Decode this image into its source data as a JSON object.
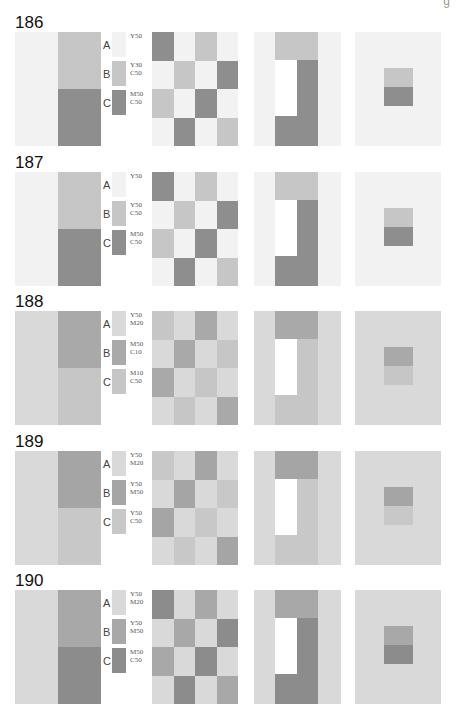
{
  "page_mark": "g",
  "sections": [
    {
      "number": "186",
      "colors": {
        "A": "#f2f2f2",
        "B": "#c6c6c6",
        "C": "#8e8e8e"
      },
      "legend": [
        {
          "letter": "A",
          "code": "Y50"
        },
        {
          "letter": "B",
          "code": "Y30\nC50"
        },
        {
          "letter": "C",
          "code": "M50\nC50"
        }
      ]
    },
    {
      "number": "187",
      "colors": {
        "A": "#f2f2f2",
        "B": "#c6c6c6",
        "C": "#8e8e8e"
      },
      "legend": [
        {
          "letter": "A",
          "code": "Y50"
        },
        {
          "letter": "B",
          "code": "Y50\nC50"
        },
        {
          "letter": "C",
          "code": "M50\nC50"
        }
      ]
    },
    {
      "number": "188",
      "colors": {
        "A": "#d9d9d9",
        "B": "#a9a9a9",
        "C": "#c6c6c6"
      },
      "legend": [
        {
          "letter": "A",
          "code": "Y50\nM20"
        },
        {
          "letter": "B",
          "code": "M50\nC10"
        },
        {
          "letter": "C",
          "code": "M10\nC50"
        }
      ]
    },
    {
      "number": "189",
      "colors": {
        "A": "#d9d9d9",
        "B": "#a5a5a5",
        "C": "#c8c8c8"
      },
      "legend": [
        {
          "letter": "A",
          "code": "Y50\nM20"
        },
        {
          "letter": "B",
          "code": "Y50\nM50"
        },
        {
          "letter": "C",
          "code": "Y50\nC50"
        }
      ]
    },
    {
      "number": "190",
      "colors": {
        "A": "#d9d9d9",
        "B": "#a8a8a8",
        "C": "#8c8c8c"
      },
      "legend": [
        {
          "letter": "A",
          "code": "Y50\nM20"
        },
        {
          "letter": "B",
          "code": "Y50\nM50"
        },
        {
          "letter": "C",
          "code": "M50\nC50"
        }
      ]
    }
  ],
  "checker_pattern": [
    [
      "C",
      "A",
      "B",
      "A"
    ],
    [
      "A",
      "B",
      "A",
      "C"
    ],
    [
      "B",
      "A",
      "C",
      "A"
    ],
    [
      "A",
      "C",
      "A",
      "B"
    ]
  ]
}
